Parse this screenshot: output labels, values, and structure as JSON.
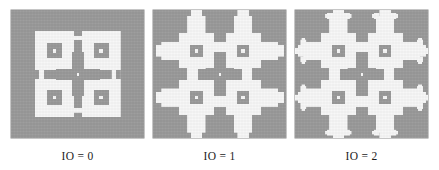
{
  "figure": {
    "background_color": "#ffffff",
    "panel_background_color": "#9a9a9a",
    "shape_color": "#f7f7f7",
    "caption_color": "#1c1c1c"
  },
  "panels": [
    {
      "id": "panel-io-0",
      "caption": "IO = 0",
      "iteration_order": 0,
      "grid_size": 9,
      "pattern_type": "vicsek-quadrant-cross",
      "description": "Four white quadrant blocks each containing a gray nested square with a white center dot, separated by a gray cross"
    },
    {
      "id": "panel-io-1",
      "caption": "IO = 1",
      "iteration_order": 1,
      "grid_size": 27,
      "pattern_type": "vicsek-quadrant-cross",
      "description": "Four white blocks with protruding arms forming a plus/cross silhouette around a gray cross center"
    },
    {
      "id": "panel-io-2",
      "caption": "IO = 2",
      "iteration_order": 2,
      "grid_size": 81,
      "pattern_type": "vicsek-quadrant-cross",
      "description": "Diamond-like stepped fractal outline with recursive cross arms on every block"
    }
  ],
  "chart_data": {
    "type": "diagram",
    "categories": [
      "IO = 0",
      "IO = 1",
      "IO = 2"
    ],
    "values": [
      0,
      1,
      2
    ],
    "xlabel": "",
    "ylabel": "",
    "legend": [],
    "annotations": [
      "IO = 0",
      "IO = 1",
      "IO = 2"
    ]
  },
  "render": {
    "canvas_pixels": 133,
    "canvas_height": 128,
    "cell_unit": 9,
    "dot_color": "#f7f7f7",
    "inner_square_color": "#9a9a9a"
  }
}
